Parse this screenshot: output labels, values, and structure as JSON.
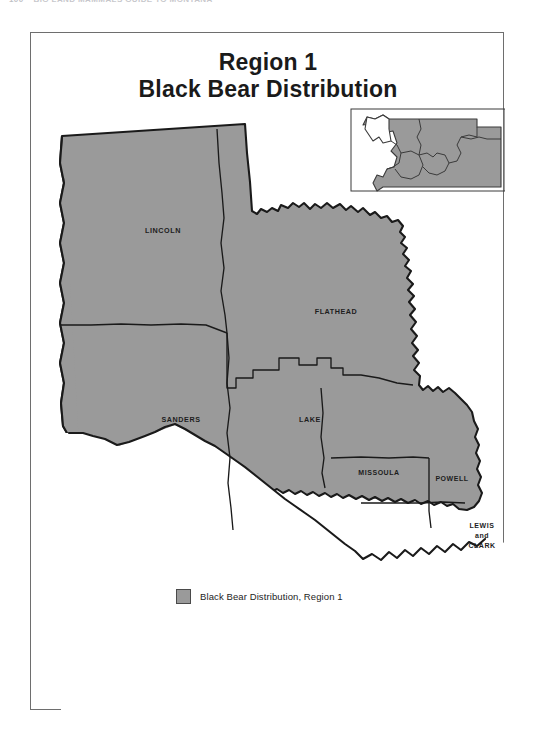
{
  "page": {
    "running_header": {
      "folio": "100",
      "run_title": "BIG LAND MAMMALS GUIDE TO MONTANA"
    }
  },
  "map": {
    "title_line_1": "Region 1",
    "title_line_2": "Black Bear Distribution",
    "fill_color": "#9a9a9a",
    "outline_color": "#1a1a1a",
    "background_color": "#ffffff",
    "county_labels": [
      {
        "name": "LINCOLN",
        "text": "LINCOLN",
        "x": 132,
        "y": 200
      },
      {
        "name": "FLATHEAD",
        "text": "FLATHEAD",
        "x": 302,
        "y": 281
      },
      {
        "name": "SANDERS",
        "text": "SANDERS",
        "x": 153,
        "y": 389
      },
      {
        "name": "LAKE",
        "text": "LAKE",
        "x": 283,
        "y": 389
      },
      {
        "name": "MISSOULA",
        "text": "MISSOULA",
        "x": 345,
        "y": 441
      },
      {
        "name": "POWELL",
        "text": "POWELL",
        "x": 421,
        "y": 447
      }
    ],
    "lewis_and_clark": {
      "line_1": "LEWIS",
      "line_2": "and",
      "line_3": "CLARK"
    },
    "inset": {
      "name": "montana-state-inset",
      "highlighted_region": "Region 1",
      "highlight_color": "#ffffff",
      "other_regions_color": "#9a9a9a"
    }
  },
  "legend": {
    "swatch_color": "#9a9a9a",
    "label": "Black Bear Distribution, Region 1"
  }
}
